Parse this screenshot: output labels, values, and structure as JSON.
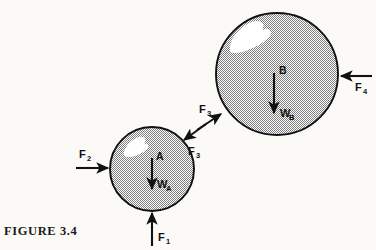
{
  "figure": {
    "caption": "FIGURE 3.4",
    "background_color": "#fbfaf7",
    "ink_color": "#111111",
    "fill_color": "#b9b9b9",
    "highlight_color": "#ffffff"
  },
  "bodies": [
    {
      "id": "sphere-a",
      "point_label": "A",
      "weight_label": "W",
      "weight_subscript": "A",
      "cx": 152,
      "cy": 169,
      "r": 42
    },
    {
      "id": "sphere-b",
      "point_label": "B",
      "weight_label": "W",
      "weight_subscript": "B",
      "cx": 277,
      "cy": 74,
      "r": 61
    }
  ],
  "forces": [
    {
      "id": "force-f1",
      "label": "F",
      "subscript": "1",
      "direction": "up",
      "applied_to": "sphere-a",
      "label_x": 178,
      "label_y": 237
    },
    {
      "id": "force-f2",
      "label": "F",
      "subscript": "2",
      "direction": "right",
      "applied_to": "sphere-a",
      "label_x": 79,
      "label_y": 155
    },
    {
      "id": "force-f3-on-b",
      "label": "F",
      "subscript": "3",
      "direction": "up-right",
      "applied_to": "sphere-b",
      "label_x": 199,
      "label_y": 110
    },
    {
      "id": "force-f3-on-a",
      "label": "F",
      "subscript": "3",
      "direction": "down-left",
      "applied_to": "sphere-a",
      "label_x": 190,
      "label_y": 152
    },
    {
      "id": "force-f4",
      "label": "F",
      "subscript": "4",
      "direction": "left",
      "applied_to": "sphere-b",
      "label_x": 357,
      "label_y": 95
    }
  ]
}
